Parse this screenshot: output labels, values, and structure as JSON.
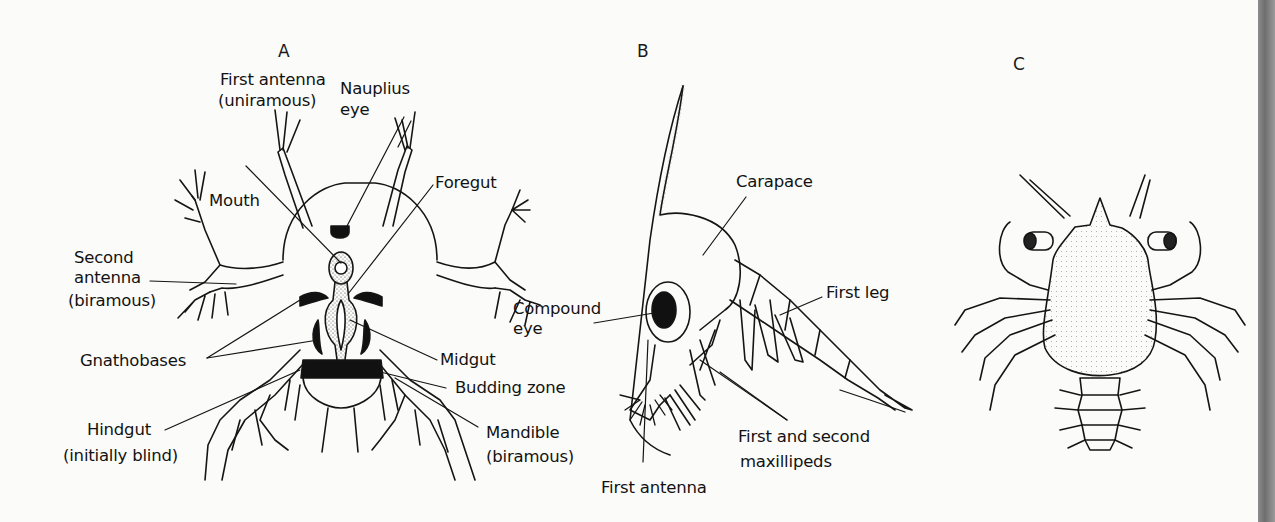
{
  "figure": {
    "panels": [
      {
        "id": "A",
        "letter": "A",
        "subject": "nauplius larva",
        "labels": {
          "first_antenna_l1": "First antenna",
          "first_antenna_l2": "(uniramous)",
          "nauplius_eye_l1": "Nauplius",
          "nauplius_eye_l2": "eye",
          "foregut": "Foregut",
          "mouth": "Mouth",
          "second_antenna_l1": "Second",
          "second_antenna_l2": "antenna",
          "second_antenna_l3": "(biramous)",
          "gnathobases": "Gnathobases",
          "midgut": "Midgut",
          "budding_zone": "Budding zone",
          "hindgut_l1": "Hindgut",
          "hindgut_l2": "(initially blind)",
          "mandible_l1": "Mandible",
          "mandible_l2": "(biramous)"
        }
      },
      {
        "id": "B",
        "letter": "B",
        "subject": "zoea larva",
        "labels": {
          "carapace": "Carapace",
          "compound_eye_l1": "Compound",
          "compound_eye_l2": "eye",
          "first_leg": "First leg",
          "maxillipeds_l1": "First and second",
          "maxillipeds_l2": "maxillipeds",
          "first_antenna": "First antenna"
        }
      },
      {
        "id": "C",
        "letter": "C",
        "subject": "megalopa / post-larva (crab)",
        "labels": {}
      }
    ]
  },
  "colors": {
    "background": "#fbfbfa",
    "ink": "#141414",
    "edge_strip": "#7e7e7e"
  }
}
